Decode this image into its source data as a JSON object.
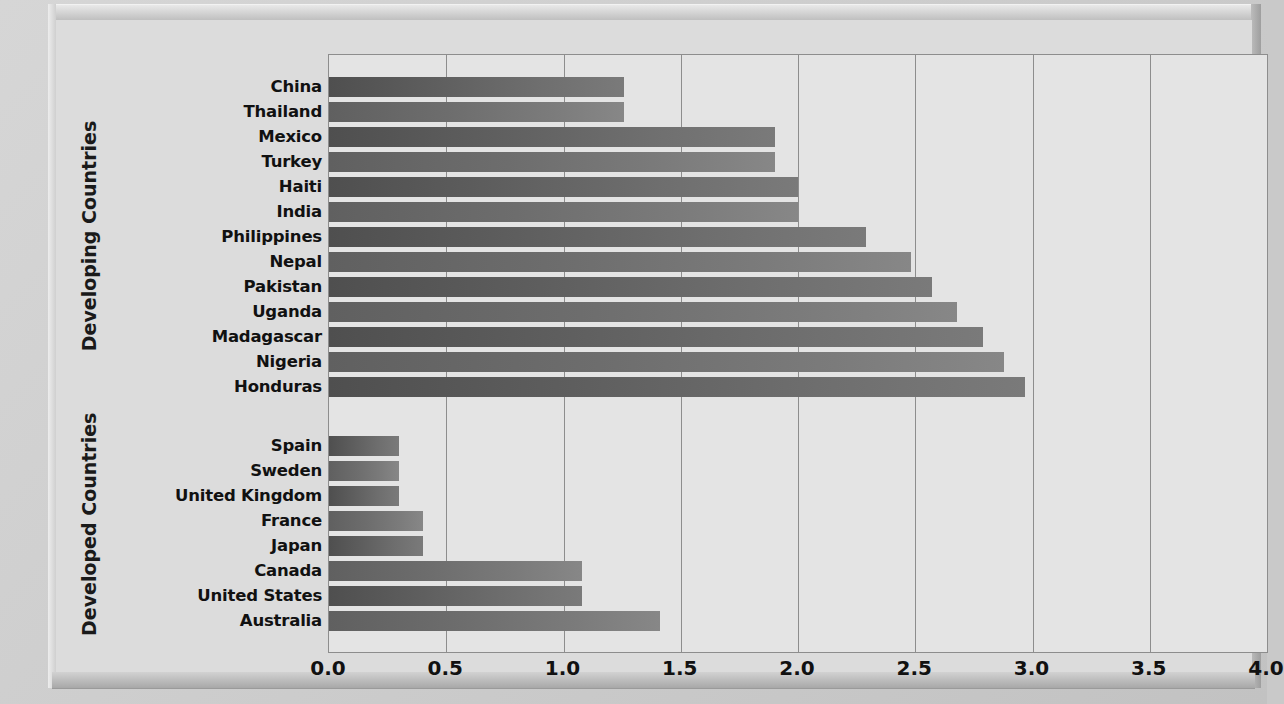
{
  "chart_data": {
    "type": "bar",
    "orientation": "horizontal",
    "title": "",
    "xlabel": "",
    "ylabel": "",
    "xlim": [
      0.0,
      4.0
    ],
    "xticks": [
      "0.0",
      "0.5",
      "1.0",
      "1.5",
      "2.0",
      "2.5",
      "3.0",
      "3.5",
      "4.0"
    ],
    "xtick_values": [
      0.0,
      0.5,
      1.0,
      1.5,
      2.0,
      2.5,
      3.0,
      3.5,
      4.0
    ],
    "grid": "vertical",
    "legend": "none",
    "groups": [
      {
        "name": "Developing Countries",
        "categories": [
          "China",
          "Thailand",
          "Mexico",
          "Turkey",
          "Haiti",
          "India",
          "Philippines",
          "Nepal",
          "Pakistan",
          "Uganda",
          "Madagascar",
          "Nigeria",
          "Honduras"
        ],
        "values": [
          1.26,
          1.26,
          1.9,
          1.9,
          2.0,
          2.0,
          2.29,
          2.48,
          2.57,
          2.68,
          2.79,
          2.88,
          2.97
        ]
      },
      {
        "name": "Developed Countries",
        "categories": [
          "Spain",
          "Sweden",
          "United Kingdom",
          "France",
          "Japan",
          "Canada",
          "United States",
          "Australia"
        ],
        "values": [
          0.3,
          0.3,
          0.3,
          0.4,
          0.4,
          1.08,
          1.08,
          1.41
        ]
      }
    ],
    "categories": [
      "China",
      "Thailand",
      "Mexico",
      "Turkey",
      "Haiti",
      "India",
      "Philippines",
      "Nepal",
      "Pakistan",
      "Uganda",
      "Madagascar",
      "Nigeria",
      "Honduras",
      "Spain",
      "Sweden",
      "United Kingdom",
      "France",
      "Japan",
      "Canada",
      "United States",
      "Australia"
    ],
    "values": [
      1.26,
      1.26,
      1.9,
      1.9,
      2.0,
      2.0,
      2.29,
      2.48,
      2.57,
      2.68,
      2.79,
      2.88,
      2.97,
      0.3,
      0.3,
      0.3,
      0.4,
      0.4,
      1.08,
      1.08,
      1.41
    ],
    "colors": {
      "bar_dark": "#4f4f4f",
      "bar_light": "#7a7a7a",
      "plot_background": "#e4e4e4",
      "panel_background": "#dcdcdc",
      "gridline": "#8d8d8d",
      "text": "#111111"
    }
  },
  "axis_labels": {
    "developing": "Developing Countries",
    "developed": "Developed Countries"
  }
}
